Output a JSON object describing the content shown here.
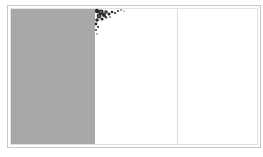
{
  "document": {
    "type": "tri-fold card template",
    "panels": [
      {
        "id": "left",
        "fill": "#a9a9a9",
        "content": ""
      },
      {
        "id": "middle",
        "fill": "#ffffff",
        "content": ""
      },
      {
        "id": "right",
        "fill": "#ffffff",
        "content": ""
      }
    ],
    "ornament": {
      "icon": "floral-corner-icon",
      "color": "#2a2a2a",
      "position": "top-left of middle panel"
    },
    "border_color": "#c8c8c8"
  }
}
